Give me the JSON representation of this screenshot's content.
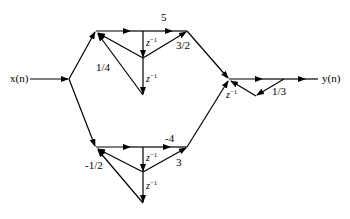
{
  "diagram": {
    "type": "signal-flow-graph",
    "input_label": "x(n)",
    "output_label": "y(n)",
    "upper_branch": {
      "input_gain": "1/4",
      "forward_gain": "5",
      "feedback_gain": "3/2",
      "delay1": "z",
      "delay2": "z"
    },
    "lower_branch": {
      "input_gain": "-1/2",
      "forward_gain": "-4",
      "feedback_gain": "3",
      "delay1": "z",
      "delay2": "z"
    },
    "output_section": {
      "feedback_gain": "1/3",
      "delay": "z"
    },
    "delay_exponent": "−1",
    "colors": {
      "stroke": "#000000",
      "background": "#ffffff"
    }
  }
}
